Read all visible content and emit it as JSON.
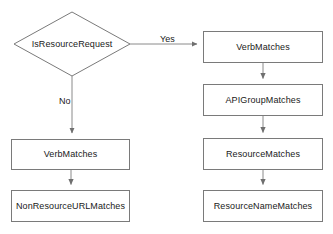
{
  "diagram": {
    "background_color": "#ffffff",
    "stroke_color": "#7a7a7a",
    "text_color": "#1a1a1a",
    "nodes": [
      {
        "id": "is-resource-request",
        "shape": "diamond",
        "label": "IsResourceRequest",
        "x": 14,
        "y": 12,
        "w": 116,
        "h": 64
      },
      {
        "id": "right-verb-matches",
        "shape": "rect",
        "label": "VerbMatches",
        "x": 203,
        "y": 31,
        "w": 120,
        "h": 32
      },
      {
        "id": "api-group-matches",
        "shape": "rect",
        "label": "APIGroupMatches",
        "x": 203,
        "y": 84,
        "w": 120,
        "h": 32
      },
      {
        "id": "right-resource-matches",
        "shape": "rect",
        "label": "ResourceMatches",
        "x": 203,
        "y": 138,
        "w": 120,
        "h": 32
      },
      {
        "id": "resource-name-matches",
        "shape": "rect",
        "label": "ResourceNameMatches",
        "x": 203,
        "y": 190,
        "w": 120,
        "h": 32
      },
      {
        "id": "left-verb-matches",
        "shape": "rect",
        "label": "VerbMatches",
        "x": 11,
        "y": 139,
        "w": 119,
        "h": 31
      },
      {
        "id": "non-resource-url-matches",
        "shape": "rect",
        "label": "NonResourceURLMatches",
        "x": 11,
        "y": 190,
        "w": 119,
        "h": 32
      }
    ],
    "edges": [
      {
        "id": "yes-branch",
        "from": "is-resource-request",
        "to": "right-verb-matches",
        "label": "Yes",
        "label_x": 160,
        "label_y": 34
      },
      {
        "id": "no-branch",
        "from": "is-resource-request",
        "to": "left-verb-matches",
        "label": "No",
        "label_x": 59,
        "label_y": 96
      },
      {
        "id": "verb-to-apigroup",
        "from": "right-verb-matches",
        "to": "api-group-matches",
        "label": ""
      },
      {
        "id": "apigroup-to-resource",
        "from": "api-group-matches",
        "to": "right-resource-matches",
        "label": ""
      },
      {
        "id": "resource-to-resourcename",
        "from": "right-resource-matches",
        "to": "resource-name-matches",
        "label": ""
      },
      {
        "id": "verb-to-nonresourceurl",
        "from": "left-verb-matches",
        "to": "non-resource-url-matches",
        "label": ""
      }
    ]
  }
}
